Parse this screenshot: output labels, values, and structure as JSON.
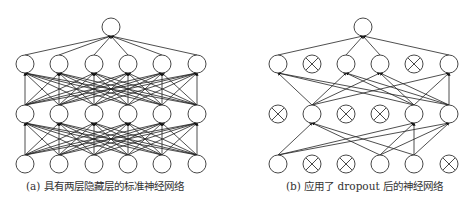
{
  "figure": {
    "panels": [
      {
        "id": "a",
        "caption": "(a) 具有两层隐藏层的标准神经网络",
        "layers": {
          "output": {
            "y": 27,
            "nodes": [
              {
                "x": 111,
                "active": true
              }
            ]
          },
          "hidden2": {
            "y": 64,
            "nodes": [
              {
                "x": 25,
                "active": true
              },
              {
                "x": 59,
                "active": true
              },
              {
                "x": 94,
                "active": true
              },
              {
                "x": 128,
                "active": true
              },
              {
                "x": 162,
                "active": true
              },
              {
                "x": 197,
                "active": true
              }
            ]
          },
          "hidden1": {
            "y": 114,
            "nodes": [
              {
                "x": 25,
                "active": true
              },
              {
                "x": 59,
                "active": true
              },
              {
                "x": 94,
                "active": true
              },
              {
                "x": 128,
                "active": true
              },
              {
                "x": 162,
                "active": true
              },
              {
                "x": 197,
                "active": true
              }
            ]
          },
          "input": {
            "y": 164,
            "nodes": [
              {
                "x": 25,
                "active": true
              },
              {
                "x": 59,
                "active": true
              },
              {
                "x": 94,
                "active": true
              },
              {
                "x": 128,
                "active": true
              },
              {
                "x": 162,
                "active": true
              },
              {
                "x": 197,
                "active": true
              }
            ]
          }
        }
      },
      {
        "id": "b",
        "caption": "(b) 应用了 dropout 后的神经网络",
        "layers": {
          "output": {
            "y": 27,
            "nodes": [
              {
                "x": 363,
                "active": true
              }
            ]
          },
          "hidden2": {
            "y": 64,
            "nodes": [
              {
                "x": 278,
                "active": true
              },
              {
                "x": 312,
                "active": false
              },
              {
                "x": 346,
                "active": true
              },
              {
                "x": 380,
                "active": true
              },
              {
                "x": 414,
                "active": false
              },
              {
                "x": 449,
                "active": true
              }
            ]
          },
          "hidden1": {
            "y": 114,
            "nodes": [
              {
                "x": 278,
                "active": false
              },
              {
                "x": 312,
                "active": true
              },
              {
                "x": 346,
                "active": false
              },
              {
                "x": 380,
                "active": false
              },
              {
                "x": 414,
                "active": true
              },
              {
                "x": 449,
                "active": true
              }
            ]
          },
          "input": {
            "y": 164,
            "nodes": [
              {
                "x": 278,
                "active": true
              },
              {
                "x": 312,
                "active": false
              },
              {
                "x": 346,
                "active": false
              },
              {
                "x": 380,
                "active": true
              },
              {
                "x": 414,
                "active": true
              },
              {
                "x": 449,
                "active": false
              }
            ]
          }
        }
      }
    ],
    "node_radius": 9,
    "colors": {
      "line": "#222222",
      "node_stroke": "#333333",
      "background": "#ffffff"
    }
  }
}
